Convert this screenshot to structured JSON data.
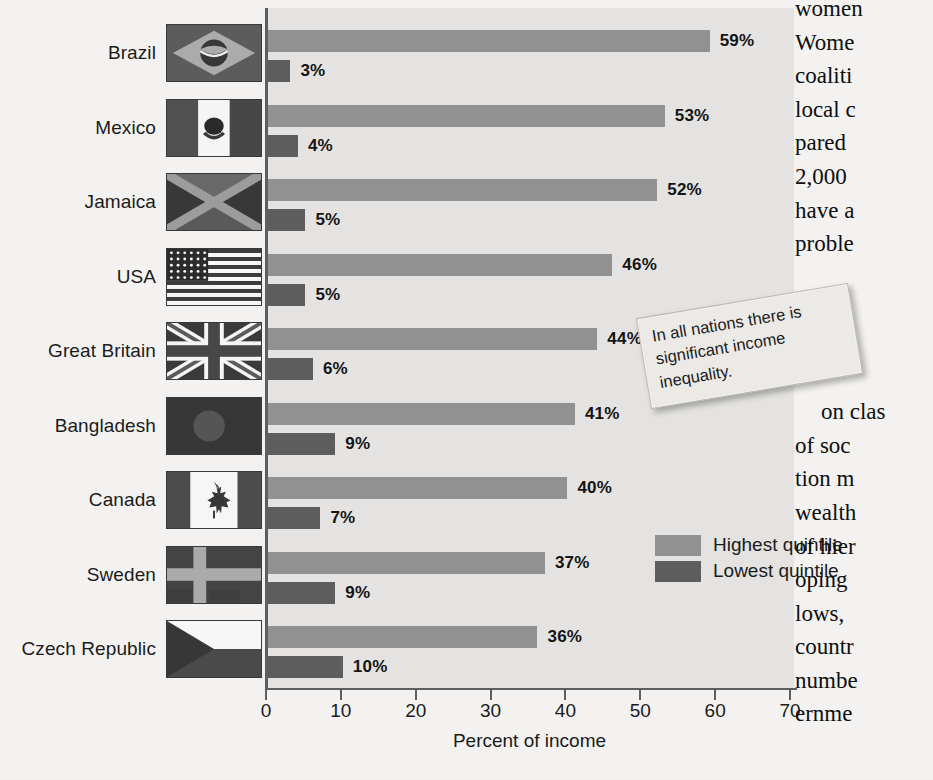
{
  "chart_data": {
    "type": "bar",
    "orientation": "horizontal",
    "title": "",
    "xlabel": "Percent of income",
    "ylabel": "",
    "xlim": [
      0,
      70
    ],
    "xticks": [
      0,
      10,
      20,
      30,
      40,
      50,
      60,
      70
    ],
    "grid": false,
    "legend_position": "inside-bottom-right",
    "categories": [
      "Brazil",
      "Mexico",
      "Jamaica",
      "USA",
      "Great Britain",
      "Bangladesh",
      "Canada",
      "Sweden",
      "Czech Republic"
    ],
    "series": [
      {
        "name": "Highest quintile",
        "color": "#919191",
        "values": [
          59,
          53,
          52,
          46,
          44,
          41,
          40,
          37,
          36
        ],
        "labels": [
          "59%",
          "53%",
          "52%",
          "46%",
          "44%",
          "41%",
          "40%",
          "37%",
          "36%"
        ]
      },
      {
        "name": "Lowest quintile",
        "color": "#5d5d5d",
        "values": [
          3,
          4,
          5,
          5,
          6,
          9,
          7,
          9,
          10
        ],
        "labels": [
          "3%",
          "4%",
          "5%",
          "5%",
          "6%",
          "9%",
          "7%",
          "9%",
          "10%"
        ]
      }
    ],
    "annotation": "In all nations there is significant income inequality."
  },
  "figure": {
    "axis": {
      "title": "Percent of income",
      "tick_labels": [
        "0",
        "10",
        "20",
        "30",
        "40",
        "50",
        "60",
        "70"
      ]
    },
    "legend": {
      "highest_label": "Highest quintile",
      "lowest_label": "Lowest quintile"
    },
    "callout": {
      "text": "In all nations there is significant income inequality."
    },
    "countries": [
      {
        "name": "Brazil",
        "flag": "flag-brazil",
        "high": "59%",
        "low": "3%"
      },
      {
        "name": "Mexico",
        "flag": "flag-mexico",
        "high": "53%",
        "low": "4%"
      },
      {
        "name": "Jamaica",
        "flag": "flag-jamaica",
        "high": "52%",
        "low": "5%"
      },
      {
        "name": "USA",
        "flag": "flag-usa",
        "high": "46%",
        "low": "5%"
      },
      {
        "name": "Great Britain",
        "flag": "flag-great-britain",
        "high": "44%",
        "low": "6%"
      },
      {
        "name": "Bangladesh",
        "flag": "flag-bangladesh",
        "high": "41%",
        "low": "9%"
      },
      {
        "name": "Canada",
        "flag": "flag-canada",
        "high": "40%",
        "low": "7%"
      },
      {
        "name": "Sweden",
        "flag": "flag-sweden",
        "high": "37%",
        "low": "9%"
      },
      {
        "name": "Czech Republic",
        "flag": "flag-czech-republic",
        "high": "36%",
        "low": "10%"
      }
    ]
  },
  "body_text": {
    "lines": [
      "women",
      "Wome",
      "coaliti",
      "local c",
      "pared",
      "2,000",
      "have a",
      "proble",
      "",
      "",
      "",
      "",
      "on clas",
      "of soc",
      "tion m",
      "wealth",
      "of hier",
      "oping",
      "lows, ",
      "countr",
      "numbe",
      "ernme"
    ]
  },
  "colors": {
    "highest_quintile": "#919191",
    "lowest_quintile": "#5d5d5d",
    "plot_background": "#e4e3e1",
    "page_background": "#f3f2f0",
    "axis": "#5e5e5e"
  }
}
